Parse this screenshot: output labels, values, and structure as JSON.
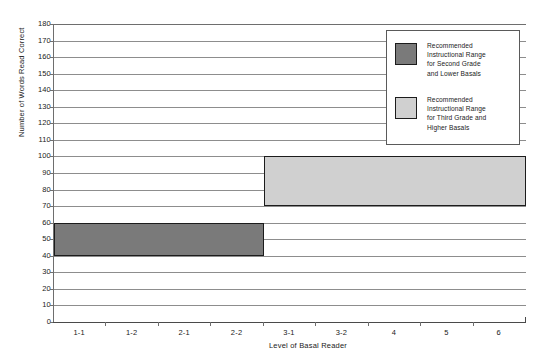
{
  "chart_data": {
    "type": "bar",
    "orientation": "horizontal-band",
    "title": "",
    "xlabel": "Level of Basal Reader",
    "ylabel": "Number of Words Read Correct",
    "categories": [
      "1-1",
      "1-2",
      "2-1",
      "2-2",
      "3-1",
      "3-2",
      "4",
      "5",
      "6"
    ],
    "ylim": [
      0,
      180
    ],
    "y_ticks": [
      0,
      10,
      20,
      30,
      40,
      50,
      60,
      70,
      80,
      90,
      100,
      110,
      120,
      130,
      140,
      150,
      160,
      170,
      180
    ],
    "grid": true,
    "legend_position": "top-right",
    "series": [
      {
        "name": "Recommended Instructional Range for Second Grade and Lower Basals",
        "color": "#7a7a7a",
        "y_low": 40,
        "y_high": 60,
        "x_start_category": "1-1",
        "x_end_category": "2-2",
        "x_start_fraction": 0.0,
        "x_end_fraction": 0.445
      },
      {
        "name": "Recommended Instructional Range for Third Grade and Higher Basals",
        "color": "#d0d0d0",
        "y_low": 70,
        "y_high": 100,
        "x_start_category": "3-1",
        "x_end_category": "6",
        "x_start_fraction": 0.445,
        "x_end_fraction": 1.0
      }
    ]
  },
  "axes": {
    "y_title": "Number of Words Read Correct",
    "x_title": "Level of Basal Reader",
    "y_tick_labels": [
      "180",
      "170",
      "160",
      "150",
      "140",
      "130",
      "120",
      "110",
      "100",
      "90",
      "80",
      "70",
      "60",
      "50",
      "40",
      "30",
      "20",
      "10",
      "0"
    ],
    "x_tick_labels": [
      "1-1",
      "1-2",
      "2-1",
      "2-2",
      "3-1",
      "3-2",
      "4",
      "5",
      "6"
    ]
  },
  "legend": {
    "entries": [
      {
        "swatch_color": "#7a7a7a",
        "lines": [
          "Recommended",
          "Instructional Range",
          "for Second Grade",
          "and Lower Basals"
        ]
      },
      {
        "swatch_color": "#d0d0d0",
        "lines": [
          "Recommended",
          "Instructional Range",
          "for Third Grade and",
          "Higher Basals"
        ]
      }
    ]
  },
  "colors": {
    "dark_band": "#7a7a7a",
    "light_band": "#d0d0d0",
    "band_border": "#1c1c1c",
    "gridline": "#8d8d8d",
    "axis": "#4a4a4a",
    "background": "#ffffff"
  }
}
